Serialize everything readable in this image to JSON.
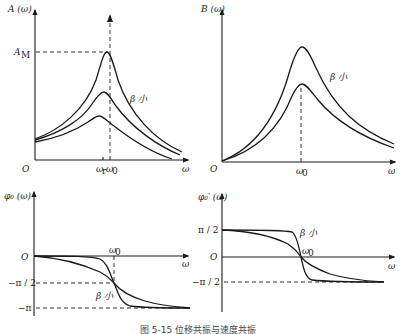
{
  "figure": {
    "caption": "图 5-15  位移共振与速度共振",
    "panels": [
      {
        "id": "amplitude",
        "y_label": "A (ω)",
        "x_label": "ω",
        "origin": "O",
        "marker_y": "A_M",
        "marker_y_main": "A",
        "marker_y_sub": "M",
        "tick_r": "ω",
        "tick_r_sub": "r",
        "tick_0": "ω",
        "tick_0_sub": "0",
        "annotation": "β 小"
      },
      {
        "id": "velocity",
        "y_label": "B (ω)",
        "x_label": "ω",
        "origin": "O",
        "tick_0": "ω",
        "tick_0_sub": "0",
        "annotation": "β 小"
      },
      {
        "id": "phase_displacement",
        "y_label": "φ₀ (ω)",
        "x_label": "ω",
        "origin": "O",
        "tick_0": "ω",
        "tick_0_sub": "0",
        "level_1": "−π / 2",
        "level_2": "−π",
        "annotation": "β 小"
      },
      {
        "id": "phase_velocity",
        "y_label": "φ₀′ (ω)",
        "x_label": "ω",
        "origin": "O",
        "tick_0": "ω",
        "tick_0_sub": "0",
        "level_top": "π / 2",
        "level_bottom": "−π / 2",
        "annotation": "β 小"
      }
    ]
  }
}
